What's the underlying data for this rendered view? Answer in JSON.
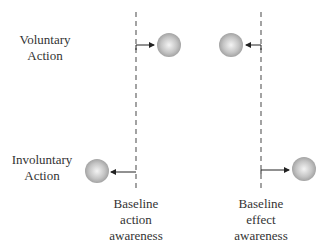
{
  "rows": {
    "voluntary": {
      "label_line1": "Voluntary",
      "label_line2": "Action"
    },
    "involuntary": {
      "label_line1": "Involuntary",
      "label_line2": "Action"
    }
  },
  "baselines": {
    "action": {
      "line1": "Baseline",
      "line2": "action",
      "line3": "awareness"
    },
    "effect": {
      "line1": "Baseline",
      "line2": "effect",
      "line3": "awareness"
    }
  },
  "colors": {
    "dash": "#666666",
    "arrow": "#222222",
    "ball_light": "#f2f2f2",
    "ball_dark": "#9a9a9a"
  }
}
